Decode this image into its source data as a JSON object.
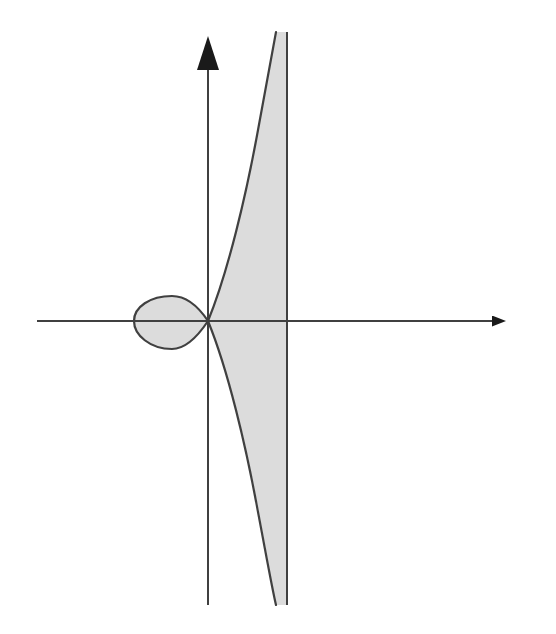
{
  "figure": {
    "width": 556,
    "height": 634,
    "background_color": "#ffffff"
  },
  "style": {
    "stroke_color": "#404040",
    "axis_color": "#404040",
    "fill_color": "#dcdcdc",
    "fill_color_light": "#e2e2e2",
    "stroke_width": 2.2,
    "axis_stroke_width": 2.0,
    "asymptote_stroke_width": 2.0
  },
  "chart_data": {
    "type": "line",
    "title": "",
    "subtitle": "",
    "xlabel": "",
    "ylabel": "",
    "grid": false,
    "legend": null,
    "axes": {
      "origin_px": [
        208,
        321
      ],
      "x_axis": {
        "start_px": [
          37,
          321
        ],
        "end_px": [
          533,
          321
        ],
        "arrow": "right",
        "arrow_tip_px": [
          533,
          321
        ],
        "arrow_base_px": [
          492,
          321
        ],
        "arrow_half_width_px": 11
      },
      "y_axis": {
        "start_px": [
          208,
          605
        ],
        "end_px": [
          208,
          36
        ],
        "arrow": "up",
        "arrow_tip_px": [
          208,
          36
        ],
        "arrow_base_px": [
          208,
          70
        ],
        "arrow_half_width_px": 11
      },
      "tick_labels_x": [],
      "tick_labels_y": []
    },
    "asymptote": {
      "kind": "vertical",
      "x_px": 287,
      "y_top_px": 32,
      "y_bottom_px": 605,
      "label": ""
    },
    "curve": {
      "name": "strophoid",
      "node_px": [
        208,
        321
      ],
      "loop": {
        "present": true,
        "side": "left",
        "leftmost_px": [
          134,
          321
        ],
        "top_px": [
          168,
          296
        ],
        "bottom_px": [
          168,
          349
        ],
        "shaded": true
      },
      "upper_branch": {
        "from_px": [
          208,
          321
        ],
        "to_px": [
          276,
          32
        ],
        "approaches_asymptote": true,
        "shaded_to_asymptote": true
      },
      "lower_branch": {
        "from_px": [
          208,
          321
        ],
        "to_px": [
          276,
          605
        ],
        "approaches_asymptote": true,
        "shaded_to_asymptote": true
      }
    },
    "shaded_regions": [
      {
        "name": "loop-interior",
        "description": "Interior of the left-hand loop",
        "fill": "#dcdcdc"
      },
      {
        "name": "asymptotic-region",
        "description": "Region between the two branches and the vertical asymptote",
        "fill": "#dcdcdc"
      }
    ]
  }
}
